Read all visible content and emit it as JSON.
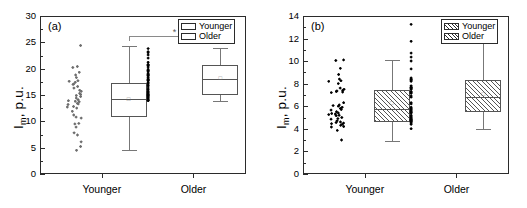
{
  "figure": {
    "panels": [
      {
        "tag": "(a)",
        "ylabel_main": "I",
        "ylabel_sub": "m",
        "ylabel_rest": ", p.u.",
        "legend": [
          {
            "label": "Younger",
            "fill": "open"
          },
          {
            "label": "Older",
            "fill": "open"
          }
        ],
        "significance": {
          "marker": "*"
        }
      },
      {
        "tag": "(b)",
        "ylabel_main": "I",
        "ylabel_sub": "m",
        "ylabel_rest": ", p.u.",
        "legend": [
          {
            "label": "Younger",
            "fill": "hatch"
          },
          {
            "label": "Older",
            "fill": "hatch"
          }
        ]
      }
    ]
  },
  "chart_data": [
    {
      "type": "box",
      "panel": "(a)",
      "title": "",
      "xlabel": "",
      "ylabel": "I_m, p.u.",
      "ylim": [
        0,
        30
      ],
      "yticks": [
        0,
        5,
        10,
        15,
        20,
        25,
        30
      ],
      "yminor_step": 2.5,
      "grid": false,
      "legend_position": "top-right",
      "categories": [
        "Younger",
        "Older"
      ],
      "annotations": [
        {
          "type": "significance-bracket",
          "from": "Younger",
          "to": "Older",
          "marker": "*",
          "y": 26.3
        }
      ],
      "series": [
        {
          "name": "Younger",
          "box": {
            "whisker_low": 4.8,
            "q1": 11.1,
            "median": 14.5,
            "q3": 17.5,
            "whisker_high": 24.5,
            "mean": 14.4
          },
          "points": [
            24.6,
            20.4,
            20.6,
            19.0,
            18.5,
            17.9,
            17.3,
            17.6,
            17.8,
            17.2,
            16.1,
            16.5,
            15.9,
            15.5,
            15.1,
            14.9,
            14.6,
            14.3,
            14.0,
            13.9,
            13.6,
            13.5,
            13.4,
            13.0,
            12.9,
            12.7,
            12.1,
            11.4,
            11.0,
            10.8,
            9.8,
            9.7,
            9.1,
            8.0,
            7.6,
            6.3,
            5.4,
            4.7,
            19.5,
            16.8,
            15.3,
            14.1
          ]
        },
        {
          "name": "Older",
          "box": {
            "whisker_low": 14.1,
            "q1": 15.2,
            "median": 18.3,
            "q3": 20.8,
            "whisker_high": 24.2,
            "mean": 18.5
          },
          "points": [
            24.0,
            23.4,
            23.2,
            22.8,
            22.2,
            21.4,
            21.0,
            20.9,
            20.8,
            20.5,
            20.1,
            19.9,
            19.6,
            19.3,
            19.1,
            19.0,
            18.9,
            18.6,
            18.4,
            18.2,
            18.0,
            17.9,
            17.6,
            17.4,
            17.1,
            16.9,
            16.5,
            16.2,
            15.9,
            15.7,
            15.5,
            15.3,
            15.2,
            15.1,
            14.9,
            14.7,
            14.5,
            14.3,
            14.2,
            14.1,
            19.8,
            18.1
          ]
        }
      ]
    },
    {
      "type": "box",
      "panel": "(b)",
      "title": "",
      "xlabel": "",
      "ylabel": "I_m, p.u.",
      "ylim": [
        0,
        14
      ],
      "yticks": [
        0,
        2,
        4,
        6,
        8,
        10,
        12,
        14
      ],
      "yminor_step": 1,
      "grid": false,
      "legend_position": "top-right",
      "categories": [
        "Younger",
        "Older"
      ],
      "series": [
        {
          "name": "Younger",
          "box": {
            "whisker_low": 3.05,
            "q1": 4.7,
            "median": 5.85,
            "q3": 7.5,
            "whisker_high": 10.2,
            "mean": 6.4
          },
          "points": [
            10.2,
            10.15,
            9.45,
            8.9,
            8.5,
            8.35,
            8.3,
            8.1,
            7.7,
            7.6,
            7.5,
            7.45,
            7.4,
            7.35,
            7.3,
            6.4,
            6.2,
            6.15,
            6.1,
            6.0,
            5.9,
            5.8,
            5.75,
            5.6,
            5.5,
            5.45,
            5.4,
            5.35,
            5.3,
            5.25,
            5.1,
            5.0,
            4.95,
            4.8,
            4.7,
            4.65,
            4.6,
            4.55,
            4.5,
            4.4,
            4.3,
            4.25,
            3.95,
            3.1
          ]
        },
        {
          "name": "Older",
          "box": {
            "whisker_low": 4.1,
            "q1": 5.55,
            "median": 6.9,
            "q3": 8.45,
            "whisker_high": 11.85,
            "mean": 7.2
          },
          "points": [
            13.35,
            11.85,
            10.8,
            10.45,
            10.1,
            9.4,
            8.6,
            8.5,
            8.45,
            8.4,
            8.3,
            7.9,
            7.8,
            7.75,
            7.7,
            7.65,
            7.6,
            7.4,
            7.3,
            7.25,
            7.0,
            6.9,
            6.4,
            6.3,
            6.0,
            5.9,
            5.8,
            5.7,
            5.6,
            5.55,
            5.5,
            5.3,
            5.2,
            5.1,
            5.0,
            4.95,
            4.9,
            4.85,
            4.8,
            4.75,
            4.7,
            4.6,
            4.5,
            4.1
          ]
        }
      ]
    }
  ]
}
